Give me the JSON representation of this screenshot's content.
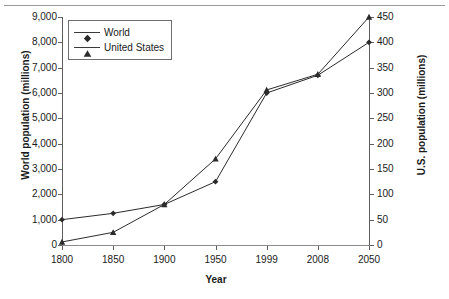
{
  "chart_data": {
    "type": "line",
    "title": "",
    "xlabel": "Year",
    "categories": [
      "1800",
      "1850",
      "1900",
      "1950",
      "1999",
      "2008",
      "2050"
    ],
    "grid": false,
    "legend_position": "top-left",
    "axes": {
      "left": {
        "label": "World population (millions)",
        "ticks": [
          "0",
          "1,000",
          "2,000",
          "3,000",
          "4,000",
          "5,000",
          "6,000",
          "7,000",
          "8,000",
          "9,000"
        ],
        "min": 0,
        "max": 9000,
        "step": 1000
      },
      "right": {
        "label": "U.S. population (millions)",
        "ticks": [
          "0",
          "50",
          "100",
          "150",
          "200",
          "250",
          "300",
          "350",
          "400",
          "450"
        ],
        "min": 0,
        "max": 450,
        "step": 50
      }
    },
    "series": [
      {
        "name": "World",
        "axis": "left",
        "marker": "diamond",
        "color": "#2b2b2b",
        "values": [
          1000,
          1250,
          1600,
          2500,
          6000,
          6700,
          8000
        ]
      },
      {
        "name": "United States",
        "axis": "right",
        "marker": "triangle",
        "color": "#2b2b2b",
        "values": [
          6,
          25,
          80,
          170,
          306,
          337,
          450
        ]
      }
    ]
  },
  "legend": {
    "items": [
      {
        "label": "World",
        "marker": "diamond"
      },
      {
        "label": "United States",
        "marker": "triangle"
      }
    ]
  }
}
